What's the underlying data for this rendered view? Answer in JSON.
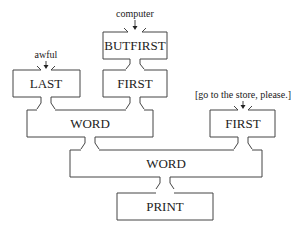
{
  "diagram": {
    "inputs": {
      "computer": "computer",
      "awful": "awful",
      "sentence": "[go to the store, please.]"
    },
    "boxes": {
      "butfirst": "BUTFIRST",
      "first_middle": "FIRST",
      "last": "LAST",
      "word_inner": "WORD",
      "first_right": "FIRST",
      "word_outer": "WORD",
      "print": "PRINT"
    }
  }
}
